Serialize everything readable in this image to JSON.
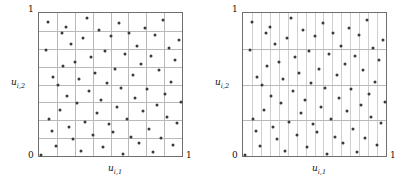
{
  "figure": {
    "type": "scatter-pair",
    "background": "#ffffff",
    "dot_color": "#3a3a3a",
    "grid_color": "#b9b9b9",
    "frame_color": "#6e6e6e"
  },
  "panels": [
    {
      "id": "left",
      "axes": {
        "xlabel": "u",
        "xlabel_sub": "i,1",
        "ylabel": "u",
        "ylabel_sub": "i,2",
        "x_ticks": [
          "0",
          "1"
        ],
        "y_ticks": [
          "0",
          "1"
        ],
        "xlim": [
          0,
          1
        ],
        "ylim": [
          0,
          1
        ]
      },
      "grid": {
        "columns": 8,
        "rows": 8,
        "style": "square"
      }
    },
    {
      "id": "right",
      "axes": {
        "xlabel": "u",
        "xlabel_sub": "i,1",
        "ylabel": "u",
        "ylabel_sub": "i,2",
        "x_ticks": [
          "0",
          "1"
        ],
        "y_ticks": [
          "0",
          "1"
        ],
        "xlim": [
          0,
          1
        ],
        "ylim": [
          0,
          1
        ]
      },
      "grid": {
        "columns": 16,
        "rows": 4,
        "style": "strips"
      }
    }
  ],
  "chart_data": {
    "type": "scatter",
    "title": "",
    "xlabel": "u_{i,1}",
    "ylabel": "u_{i,2}",
    "xlim": [
      0,
      1
    ],
    "ylim": [
      0,
      1
    ],
    "grid": true,
    "legend": "none",
    "series": [
      {
        "name": "left-panel-samples",
        "grid_columns": 8,
        "grid_rows": 8,
        "points": [
          [
            0.012,
            0.008
          ],
          [
            0.047,
            0.742
          ],
          [
            0.06,
            0.935
          ],
          [
            0.072,
            0.262
          ],
          [
            0.089,
            0.175
          ],
          [
            0.101,
            0.553
          ],
          [
            0.118,
            0.072
          ],
          [
            0.131,
            0.495
          ],
          [
            0.145,
            0.32
          ],
          [
            0.158,
            0.861
          ],
          [
            0.17,
            0.628
          ],
          [
            0.186,
            0.905
          ],
          [
            0.199,
            0.418
          ],
          [
            0.212,
            0.205
          ],
          [
            0.227,
            0.78
          ],
          [
            0.24,
            0.118
          ],
          [
            0.254,
            0.66
          ],
          [
            0.268,
            0.372
          ],
          [
            0.281,
            0.54
          ],
          [
            0.296,
            0.032
          ],
          [
            0.31,
            0.825
          ],
          [
            0.323,
            0.24
          ],
          [
            0.338,
            0.965
          ],
          [
            0.352,
            0.455
          ],
          [
            0.366,
            0.69
          ],
          [
            0.379,
            0.148
          ],
          [
            0.394,
            0.582
          ],
          [
            0.407,
            0.298
          ],
          [
            0.421,
            0.88
          ],
          [
            0.436,
            0.392
          ],
          [
            0.449,
            0.062
          ],
          [
            0.463,
            0.735
          ],
          [
            0.478,
            0.512
          ],
          [
            0.491,
            0.222
          ],
          [
            0.505,
            0.838
          ],
          [
            0.519,
            0.168
          ],
          [
            0.533,
            0.605
          ],
          [
            0.547,
            0.345
          ],
          [
            0.561,
            0.928
          ],
          [
            0.574,
            0.478
          ],
          [
            0.589,
            0.015
          ],
          [
            0.602,
            0.712
          ],
          [
            0.617,
            0.258
          ],
          [
            0.63,
            0.862
          ],
          [
            0.645,
            0.135
          ],
          [
            0.658,
            0.565
          ],
          [
            0.672,
            0.408
          ],
          [
            0.686,
            0.768
          ],
          [
            0.7,
            0.09
          ],
          [
            0.714,
            0.64
          ],
          [
            0.728,
            0.312
          ],
          [
            0.742,
            0.895
          ],
          [
            0.756,
            0.468
          ],
          [
            0.77,
            0.192
          ],
          [
            0.784,
            0.702
          ],
          [
            0.798,
            0.025
          ],
          [
            0.812,
            0.845
          ],
          [
            0.826,
            0.355
          ],
          [
            0.84,
            0.598
          ],
          [
            0.854,
            0.128
          ],
          [
            0.868,
            0.952
          ],
          [
            0.882,
            0.432
          ],
          [
            0.896,
            0.275
          ],
          [
            0.91,
            0.758
          ],
          [
            0.925,
            0.52
          ],
          [
            0.938,
            0.08
          ],
          [
            0.952,
            0.672
          ],
          [
            0.966,
            0.228
          ],
          [
            0.98,
            0.812
          ],
          [
            0.992,
            0.38
          ]
        ]
      },
      {
        "name": "right-panel-samples",
        "grid_columns": 16,
        "grid_rows": 4,
        "points": [
          [
            0.012,
            0.008
          ],
          [
            0.047,
            0.742
          ],
          [
            0.06,
            0.935
          ],
          [
            0.072,
            0.262
          ],
          [
            0.089,
            0.175
          ],
          [
            0.101,
            0.553
          ],
          [
            0.118,
            0.072
          ],
          [
            0.131,
            0.495
          ],
          [
            0.145,
            0.32
          ],
          [
            0.158,
            0.861
          ],
          [
            0.17,
            0.628
          ],
          [
            0.186,
            0.905
          ],
          [
            0.199,
            0.418
          ],
          [
            0.212,
            0.205
          ],
          [
            0.227,
            0.78
          ],
          [
            0.24,
            0.118
          ],
          [
            0.254,
            0.66
          ],
          [
            0.268,
            0.372
          ],
          [
            0.281,
            0.54
          ],
          [
            0.296,
            0.032
          ],
          [
            0.31,
            0.825
          ],
          [
            0.323,
            0.24
          ],
          [
            0.338,
            0.965
          ],
          [
            0.352,
            0.455
          ],
          [
            0.366,
            0.69
          ],
          [
            0.379,
            0.148
          ],
          [
            0.394,
            0.582
          ],
          [
            0.407,
            0.298
          ],
          [
            0.421,
            0.88
          ],
          [
            0.436,
            0.392
          ],
          [
            0.449,
            0.062
          ],
          [
            0.463,
            0.735
          ],
          [
            0.478,
            0.512
          ],
          [
            0.491,
            0.222
          ],
          [
            0.505,
            0.838
          ],
          [
            0.519,
            0.168
          ],
          [
            0.533,
            0.605
          ],
          [
            0.547,
            0.345
          ],
          [
            0.561,
            0.928
          ],
          [
            0.574,
            0.478
          ],
          [
            0.589,
            0.015
          ],
          [
            0.602,
            0.712
          ],
          [
            0.617,
            0.258
          ],
          [
            0.63,
            0.862
          ],
          [
            0.645,
            0.135
          ],
          [
            0.658,
            0.565
          ],
          [
            0.672,
            0.408
          ],
          [
            0.686,
            0.768
          ],
          [
            0.7,
            0.09
          ],
          [
            0.714,
            0.64
          ],
          [
            0.728,
            0.312
          ],
          [
            0.742,
            0.895
          ],
          [
            0.756,
            0.468
          ],
          [
            0.77,
            0.192
          ],
          [
            0.784,
            0.702
          ],
          [
            0.798,
            0.025
          ],
          [
            0.812,
            0.845
          ],
          [
            0.826,
            0.355
          ],
          [
            0.84,
            0.598
          ],
          [
            0.854,
            0.128
          ],
          [
            0.868,
            0.952
          ],
          [
            0.882,
            0.432
          ],
          [
            0.896,
            0.275
          ],
          [
            0.91,
            0.758
          ],
          [
            0.925,
            0.52
          ],
          [
            0.938,
            0.08
          ],
          [
            0.952,
            0.672
          ],
          [
            0.966,
            0.228
          ],
          [
            0.98,
            0.812
          ],
          [
            0.992,
            0.38
          ]
        ]
      }
    ]
  }
}
